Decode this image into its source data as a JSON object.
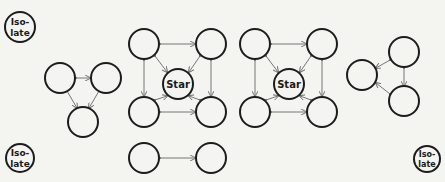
{
  "diagram": {
    "type": "sociogram",
    "node_stroke": "#1c1c1c",
    "arrow_color": "#666666",
    "background": "#f4f4f1",
    "isolates": [
      {
        "id": "iso-top-left",
        "label_line1": "Iso-",
        "label_line2": "late"
      },
      {
        "id": "iso-bottom-left",
        "label_line1": "Iso-",
        "label_line2": "late"
      },
      {
        "id": "iso-bottom-right",
        "label_line1": "Iso-",
        "label_line2": "late"
      }
    ],
    "groups": [
      {
        "id": "triangle-left",
        "description": "three mutually connected members",
        "nodes": 3
      },
      {
        "id": "star-group-middle",
        "star_label": "Star",
        "nodes": 5,
        "extra_pair": 2
      },
      {
        "id": "star-group-right",
        "star_label": "Star",
        "nodes": 5
      },
      {
        "id": "triangle-right",
        "description": "three mutually connected members",
        "nodes": 3
      }
    ]
  }
}
